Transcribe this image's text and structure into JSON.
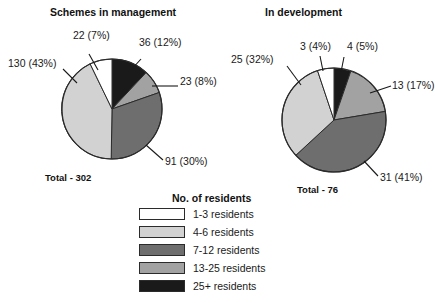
{
  "figure": {
    "background": "#ffffff"
  },
  "chart_data": [
    {
      "type": "pie",
      "title": "Schemes in management",
      "total_label": "Total - 302",
      "total_value": 302,
      "categories": [
        "25+ residents",
        "13-25 residents",
        "7-12 residents",
        "4-6 residents",
        "1-3 residents"
      ],
      "values": [
        36,
        23,
        91,
        130,
        22
      ],
      "percents": [
        12,
        8,
        30,
        43,
        7
      ],
      "data_labels": [
        "36 (12%)",
        "23 (8%)",
        "91 (30%)",
        "130 (43%)",
        "22 (7%)"
      ],
      "colors": [
        "#1a1a1a",
        "#a2a2a2",
        "#6e6e6e",
        "#d2d2d2",
        "#ffffff"
      ],
      "legend_position": "bottom-center",
      "start_angle_deg": 0,
      "direction": "clockwise"
    },
    {
      "type": "pie",
      "title": "In development",
      "total_label": "Total - 76",
      "total_value": 76,
      "categories": [
        "25+ residents",
        "13-25 residents",
        "7-12 residents",
        "4-6 residents",
        "1-3 residents"
      ],
      "values": [
        4,
        13,
        31,
        25,
        3
      ],
      "percents": [
        5,
        17,
        41,
        32,
        4
      ],
      "data_labels": [
        "4 (5%)",
        "13 (17%)",
        "31 (41%)",
        "25 (32%)",
        "3 (4%)"
      ],
      "colors": [
        "#1a1a1a",
        "#a2a2a2",
        "#6e6e6e",
        "#d2d2d2",
        "#ffffff"
      ],
      "legend_position": "bottom-center",
      "start_angle_deg": 0,
      "direction": "clockwise"
    }
  ],
  "left_chart": {
    "title": "Schemes in management",
    "total": "Total - 302",
    "labels": {
      "black": "36 (12%)",
      "mid_gray": "23 (8%)",
      "dark_gray": "91 (30%)",
      "light_gray": "130 (43%)",
      "white": "22 (7%)"
    }
  },
  "right_chart": {
    "title": "In development",
    "total": "Total - 76",
    "labels": {
      "black": "4 (5%)",
      "mid_gray": "13 (17%)",
      "dark_gray": "31 (41%)",
      "light_gray": "25 (32%)",
      "white": "3 (4%)"
    }
  },
  "legend": {
    "title": "No. of residents",
    "items": [
      {
        "label": "1-3 residents",
        "color": "#ffffff"
      },
      {
        "label": "4-6 residents",
        "color": "#d2d2d2"
      },
      {
        "label": "7-12 residents",
        "color": "#6e6e6e"
      },
      {
        "label": "13-25 residents",
        "color": "#a2a2a2"
      },
      {
        "label": "25+ residents",
        "color": "#1a1a1a"
      }
    ]
  }
}
